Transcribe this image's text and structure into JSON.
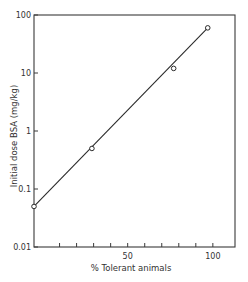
{
  "chart_data": {
    "type": "line",
    "title": "",
    "xlabel": "% Tolerant animals",
    "ylabel": "Initial dose BSA (mg/kg)",
    "xscale": "linear",
    "yscale": "log",
    "xlim": [
      -5,
      113
    ],
    "ylim": [
      0.01,
      100
    ],
    "x_ticks": [
      10,
      20,
      30,
      40,
      50,
      60,
      70,
      80,
      90,
      100
    ],
    "x_tick_labels": [
      {
        "value": 50,
        "label": "50"
      },
      {
        "value": 100,
        "label": "100"
      }
    ],
    "y_ticks": [
      {
        "value": 100,
        "label": "100"
      },
      {
        "value": 10,
        "label": "10"
      },
      {
        "value": 1,
        "label": "1"
      },
      {
        "value": 0.1,
        "label": "0.1"
      },
      {
        "value": 0.01,
        "label": "0.01"
      }
    ],
    "grid": false,
    "legend": null,
    "series": [
      {
        "name": "observed",
        "marker": "open-circle",
        "points": [
          {
            "x": -5,
            "y": 0.05
          },
          {
            "x": 29,
            "y": 0.5
          },
          {
            "x": 77,
            "y": 12
          },
          {
            "x": 97,
            "y": 60
          }
        ]
      },
      {
        "name": "fit",
        "line": "solid",
        "points": [
          {
            "x": -5,
            "y": 0.05
          },
          {
            "x": 97,
            "y": 60
          }
        ]
      }
    ]
  }
}
